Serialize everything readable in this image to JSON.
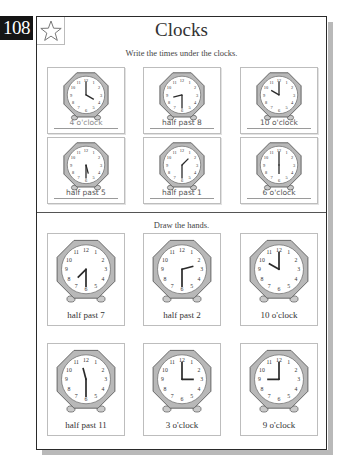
{
  "page": {
    "number": "108",
    "title": "Clocks",
    "star_icon": "star-outline-icon"
  },
  "section_write": {
    "instruction": "Write the times under the clocks.",
    "clocks": [
      {
        "label": "4 o'clock",
        "hour": 4,
        "minute": 0
      },
      {
        "label": "half past 8",
        "hour": 8,
        "minute": 30
      },
      {
        "label": "10 o'clock",
        "hour": 10,
        "minute": 0
      },
      {
        "label": "half past 5",
        "hour": 5,
        "minute": 30
      },
      {
        "label": "half past 1",
        "hour": 1,
        "minute": 30
      },
      {
        "label": "6 o'clock",
        "hour": 6,
        "minute": 0
      }
    ]
  },
  "section_draw": {
    "instruction": "Draw the hands.",
    "clocks": [
      {
        "label": "half past 7",
        "hour": 7,
        "minute": 30
      },
      {
        "label": "half past 2",
        "hour": 2,
        "minute": 30
      },
      {
        "label": "10 o'clock",
        "hour": 10,
        "minute": 0
      },
      {
        "label": "half past 11",
        "hour": 11,
        "minute": 30
      },
      {
        "label": "3 o'clock",
        "hour": 3,
        "minute": 0
      },
      {
        "label": "9 o'clock",
        "hour": 9,
        "minute": 0
      }
    ]
  },
  "colors": {
    "clock_frame": "#b8b8b8",
    "clock_frame_stroke": "#5a5a5a",
    "ink": "#2a2a2a"
  }
}
